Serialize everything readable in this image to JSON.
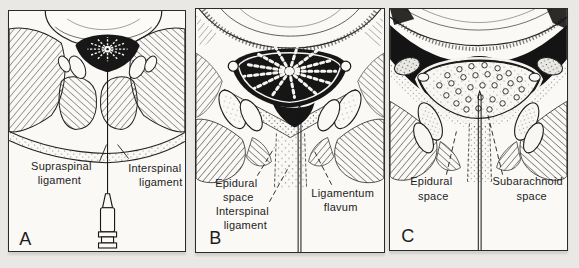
{
  "figure": {
    "colors": {
      "background": "#e9e8e4",
      "panel": "#faf9f6",
      "ink": "#1d1d1d"
    },
    "panels": [
      {
        "letter": "A",
        "labels": [
          {
            "l1": "Supraspinal",
            "l2": "ligament"
          },
          {
            "l1": "Interspinal",
            "l2": "ligament"
          }
        ]
      },
      {
        "letter": "B",
        "labels": [
          {
            "l1": "Epidural",
            "l2": "space"
          },
          {
            "l1": "Interspinal",
            "l2": "ligament"
          },
          {
            "l1": "Ligamentum",
            "l2": "flavum"
          }
        ]
      },
      {
        "letter": "C",
        "labels": [
          {
            "l1": "Epidural",
            "l2": "space"
          },
          {
            "l1": "Subarachnoid",
            "l2": "space"
          }
        ]
      }
    ]
  }
}
